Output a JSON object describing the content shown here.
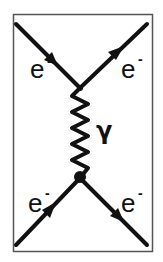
{
  "diagram": {
    "type": "feynman-diagram",
    "particles": [
      {
        "id": "incoming-top-left",
        "label": "e",
        "charge": "-",
        "direction": "incoming"
      },
      {
        "id": "outgoing-top-right",
        "label": "e",
        "charge": "-",
        "direction": "outgoing"
      },
      {
        "id": "incoming-bottom-left",
        "label": "e",
        "charge": "-",
        "direction": "incoming"
      },
      {
        "id": "outgoing-bottom-right",
        "label": "e",
        "charge": "-",
        "direction": "outgoing"
      }
    ],
    "propagator": {
      "label": "γ",
      "type": "photon"
    },
    "colors": {
      "line": "#111111",
      "frame": "#444444",
      "background": "#ffffff"
    }
  }
}
